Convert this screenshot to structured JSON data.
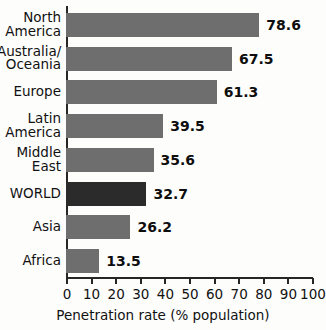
{
  "chart_data": {
    "type": "bar",
    "orientation": "horizontal",
    "title": "",
    "xlabel": "Penetration rate (% population)",
    "ylabel": "",
    "xlim": [
      0,
      100
    ],
    "grid": false,
    "legend": null,
    "categories": [
      "North\nAmerica",
      "Australia/\nOceania",
      "Europe",
      "Latin\nAmerica",
      "Middle\nEast",
      "WORLD",
      "Asia",
      "Africa"
    ],
    "values": [
      78.6,
      67.5,
      61.3,
      39.5,
      35.6,
      32.7,
      26.2,
      13.5
    ],
    "value_labels": [
      "78.6",
      "67.5",
      "61.3",
      "39.5",
      "35.6",
      "32.7",
      "26.2",
      "13.5"
    ],
    "highlight_category": "WORLD",
    "xticks": [
      0,
      10,
      20,
      30,
      40,
      50,
      60,
      70,
      80,
      90,
      100
    ],
    "xtick_labels": [
      "0",
      "10",
      "20",
      "30",
      "40",
      "50",
      "60",
      "70",
      "80",
      "90",
      "100"
    ],
    "colors": {
      "bar": "#6e6e6e",
      "bar_highlight": "#2b2b2b",
      "axis": "#262626",
      "text": "#111111",
      "background": "#fdfdfc"
    }
  }
}
